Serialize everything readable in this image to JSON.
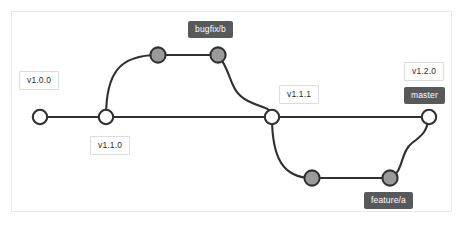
{
  "diagram": {
    "type": "git-graph",
    "canvas": {
      "background": "#ffffff",
      "border_color": "#e9e9ea"
    },
    "colors": {
      "edge": "#2f3031",
      "node_main_fill": "#ffffff",
      "node_branch_fill": "#9a9a9a",
      "node_stroke": "#2f3031",
      "tag_background": "#ffffff",
      "tag_border": "#dcdcdd",
      "tag_text": "#2f3031",
      "branch_background": "#58595b",
      "branch_text": "#ffffff"
    },
    "branches": [
      {
        "name": "master",
        "y": 117,
        "node_style": "main"
      },
      {
        "name": "bugfix/b",
        "y": 55,
        "node_style": "branch"
      },
      {
        "name": "feature/a",
        "y": 178,
        "node_style": "branch"
      }
    ],
    "commits": [
      {
        "id": "m1",
        "branch": "master",
        "x": 40,
        "y": 117,
        "style": "main"
      },
      {
        "id": "m2",
        "branch": "master",
        "x": 106,
        "y": 117,
        "style": "main"
      },
      {
        "id": "m3",
        "branch": "master",
        "x": 272,
        "y": 117,
        "style": "main"
      },
      {
        "id": "m4",
        "branch": "master",
        "x": 429,
        "y": 117,
        "style": "main"
      },
      {
        "id": "b1",
        "branch": "bugfix/b",
        "x": 158,
        "y": 55,
        "style": "branch"
      },
      {
        "id": "b2",
        "branch": "bugfix/b",
        "x": 218,
        "y": 55,
        "style": "branch"
      },
      {
        "id": "f1",
        "branch": "feature/a",
        "x": 312,
        "y": 178,
        "style": "branch"
      },
      {
        "id": "f2",
        "branch": "feature/a",
        "x": 390,
        "y": 178,
        "style": "branch"
      }
    ],
    "edges": [
      {
        "from": "m1",
        "to": "m2",
        "kind": "straight"
      },
      {
        "from": "m2",
        "to": "m3",
        "kind": "straight"
      },
      {
        "from": "m3",
        "to": "m4",
        "kind": "straight"
      },
      {
        "from": "m2",
        "to": "b1",
        "kind": "branch-out-up"
      },
      {
        "from": "b1",
        "to": "b2",
        "kind": "straight"
      },
      {
        "from": "b2",
        "to": "m3",
        "kind": "merge-down"
      },
      {
        "from": "m3",
        "to": "f1",
        "kind": "branch-out-down"
      },
      {
        "from": "f1",
        "to": "f2",
        "kind": "straight"
      },
      {
        "from": "f2",
        "to": "m4",
        "kind": "merge-up"
      }
    ],
    "labels": {
      "v100": {
        "text": "v1.0.0",
        "type": "tag",
        "attached_to": "m1"
      },
      "v110": {
        "text": "v1.1.0",
        "type": "tag",
        "attached_to": "m2"
      },
      "bugfix": {
        "text": "bugfix/b",
        "type": "branch",
        "attached_to": "b2"
      },
      "v111": {
        "text": "v1.1.1",
        "type": "tag",
        "attached_to": "m3"
      },
      "v120": {
        "text": "v1.2.0",
        "type": "tag",
        "attached_to": "m4"
      },
      "master": {
        "text": "master",
        "type": "branch",
        "attached_to": "m4"
      },
      "feature": {
        "text": "feature/a",
        "type": "branch",
        "attached_to": "f2"
      }
    }
  }
}
